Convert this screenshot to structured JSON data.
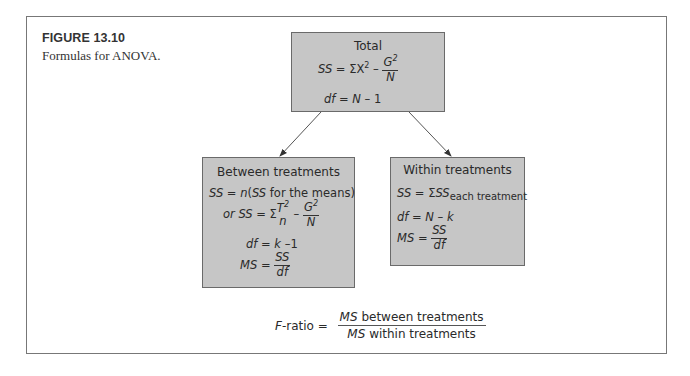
{
  "figure": {
    "label": "FIGURE 13.10",
    "caption": "Formulas for ANOVA."
  },
  "total": {
    "title": "Total",
    "ss_lhs": "SS",
    "ss_eq": " = ΣX",
    "ss_exp": "2",
    "ss_minus": " – ",
    "ss_num": "G",
    "ss_num_exp": "2",
    "ss_den": "N",
    "df_lhs": "df",
    "df_rhs": " = ",
    "df_N": "N",
    "df_tail": " – 1"
  },
  "between": {
    "title": "Between treatments",
    "ss1_lhs": "SS",
    "ss1_eq": " = ",
    "ss1_n": "n",
    "ss1_paren_open": "(",
    "ss1_ss": "SS",
    "ss1_tail": " for the means)",
    "ss2_or": "or ",
    "ss2_lhs": "SS",
    "ss2_eq": " = Σ",
    "ss2_num": "T",
    "ss2_num_exp": "2",
    "ss2_den": "n",
    "ss2_minus": " – ",
    "ss2_num2": "G",
    "ss2_num2_exp": "2",
    "ss2_den2": "N",
    "df_lhs": "df",
    "df_eq": " = ",
    "df_k": "k",
    "df_tail": " –1",
    "ms_lhs": "MS",
    "ms_eq": " = ",
    "ms_num": "SS",
    "ms_den": "df"
  },
  "within": {
    "title": "Within treatments",
    "ss_lhs": "SS",
    "ss_eq": " = Σ",
    "ss_ss": "SS",
    "ss_sub": "each treatment",
    "df_lhs": "df",
    "df_eq": " = ",
    "df_N": "N",
    "df_minus": " – ",
    "df_k": "k",
    "ms_lhs": "MS",
    "ms_eq": " = ",
    "ms_num": "SS",
    "ms_den": "df"
  },
  "fratio": {
    "lhs_F": "F",
    "lhs_rest": "-ratio = ",
    "num_ms": "MS",
    "num_text": " between treatments",
    "den_ms": "MS",
    "den_text": " within treatments"
  },
  "colors": {
    "box_fill": "#c6c6c6",
    "box_border": "#6a6a6a",
    "frame": "#777777"
  }
}
